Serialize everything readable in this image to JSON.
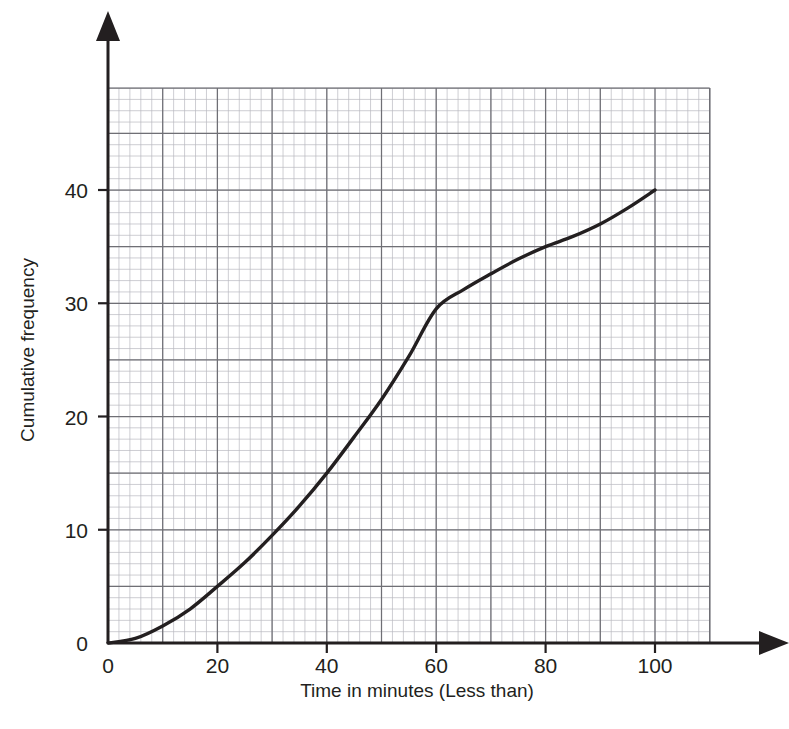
{
  "chart_data": {
    "type": "line",
    "title": "",
    "subtitle": "",
    "xlabel": "Time in minutes (Less than)",
    "ylabel": "Cumulative frequency",
    "xlim": [
      0,
      110
    ],
    "ylim": [
      0,
      49
    ],
    "xticks": [
      "0",
      "20",
      "40",
      "60",
      "80",
      "100"
    ],
    "xtick_values": [
      0,
      20,
      40,
      60,
      80,
      100
    ],
    "yticks": [
      "0",
      "10",
      "20",
      "30",
      "40"
    ],
    "ytick_values": [
      0,
      10,
      20,
      30,
      40
    ],
    "grid": "on",
    "grid_minor_step_x": 2,
    "grid_minor_step_y": 1,
    "grid_major_step_x": 10,
    "grid_major_step_y": 5,
    "legend": "none",
    "series": [
      {
        "name": "Cumulative frequency",
        "x": [
          0,
          5,
          10,
          15,
          20,
          25,
          30,
          35,
          40,
          45,
          50,
          55,
          60,
          65,
          70,
          75,
          80,
          85,
          90,
          95,
          100
        ],
        "values": [
          0,
          0.4,
          1.5,
          3.0,
          5.0,
          7.1,
          9.5,
          12.1,
          15.0,
          18.2,
          21.5,
          25.3,
          29.5,
          31.2,
          32.6,
          33.9,
          35.0,
          35.9,
          37.0,
          38.4,
          40.0
        ]
      }
    ],
    "annotations": [],
    "colors": {
      "curve": "#231f20",
      "axis": "#231f20",
      "grid_major": "#6f6f75",
      "grid_minor": "#b9b9c0",
      "background": "#ffffff",
      "text": "#231f20"
    }
  },
  "axes": {
    "x_axis_name": "x-axis",
    "y_axis_name": "y-axis",
    "x_title": "Time in minutes (Less than)",
    "y_title": "Cumulative frequency"
  },
  "artifacts": {
    "top_clipped_text": ""
  }
}
